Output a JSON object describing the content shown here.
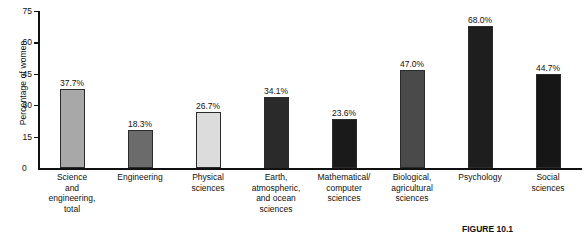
{
  "chart_data": {
    "type": "bar",
    "title": "",
    "xlabel": "",
    "ylabel": "Percentage of women",
    "ylim": [
      0,
      75
    ],
    "yticks": [
      0,
      15,
      30,
      45,
      60,
      75
    ],
    "grid": false,
    "legend": null,
    "categories": [
      "Science and engineering, total",
      "Engineering",
      "Physical sciences",
      "Earth, atmospheric, and ocean sciences",
      "Mathematical/computer sciences",
      "Biological, agricultural sciences",
      "Psychology",
      "Social sciences"
    ],
    "category_lines": [
      [
        "Science",
        "and",
        "engineering,",
        "total"
      ],
      [
        "Engineering"
      ],
      [
        "Physical",
        "sciences"
      ],
      [
        "Earth,",
        "atmospheric,",
        "and ocean",
        "sciences"
      ],
      [
        "Mathematical/",
        "computer",
        "sciences"
      ],
      [
        "Biological,",
        "agricultural",
        "sciences"
      ],
      [
        "Psychology"
      ],
      [
        "Social",
        "sciences"
      ]
    ],
    "values": [
      37.7,
      18.3,
      26.7,
      34.1,
      23.6,
      47.0,
      68.0,
      44.7
    ],
    "value_labels": [
      "37.7%",
      "18.3%",
      "26.7%",
      "34.1%",
      "23.6%",
      "47.0%",
      "68.0%",
      "44.7%"
    ],
    "bar_colors": [
      "#a8a8a8",
      "#6b6b6b",
      "#dcdcdc",
      "#2a2a2a",
      "#1a1a1a",
      "#4a4a4a",
      "#1e1e1e",
      "#161616"
    ],
    "bar_edge_color": "#2b2b2b"
  },
  "axis": {
    "y_title": "Percentage of women",
    "tick_labels": [
      "0",
      "15",
      "30",
      "45",
      "60",
      "75"
    ],
    "zero_label": "0"
  },
  "caption": {
    "text": "FIGURE 10.1"
  }
}
